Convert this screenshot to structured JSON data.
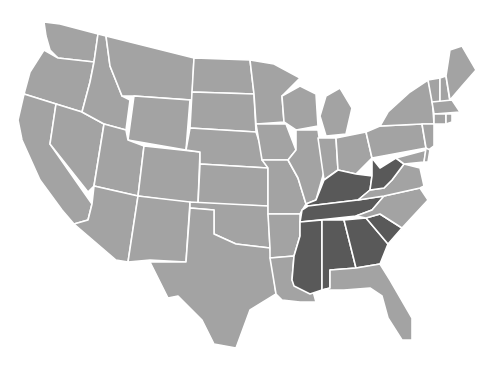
{
  "map": {
    "title": "United States map with highlighted southeastern states",
    "colors": {
      "background": "#ffffff",
      "default_state": "#a3a3a3",
      "highlighted_state": "#595959",
      "border": "#ffffff"
    },
    "highlighted_states": [
      "West Virginia",
      "Kentucky",
      "Tennessee",
      "Mississippi",
      "Alabama",
      "Georgia",
      "South Carolina"
    ],
    "states": [
      {
        "id": "WA",
        "name": "Washington",
        "highlighted": false,
        "points": "44,22 60,24 98,34 94,62 58,58 50,50 46,36"
      },
      {
        "id": "OR",
        "name": "Oregon",
        "highlighted": false,
        "points": "24,94 30,72 44,50 58,58 94,62 90,82 82,112"
      },
      {
        "id": "CA",
        "name": "California",
        "highlighted": false,
        "points": "24,94 56,104 50,144 92,204 88,220 74,224 62,210 40,180 22,140 18,120"
      },
      {
        "id": "NV",
        "name": "Nevada",
        "highlighted": false,
        "points": "56,104 82,112 104,124 94,186 88,192 50,144"
      },
      {
        "id": "ID",
        "name": "Idaho",
        "highlighted": false,
        "points": "98,34 106,36 110,66 122,96 130,100 126,130 104,124 82,112 90,82 94,62"
      },
      {
        "id": "MT",
        "name": "Montana",
        "highlighted": false,
        "points": "106,36 194,58 192,100 134,96 122,96 110,66"
      },
      {
        "id": "WY",
        "name": "Wyoming",
        "highlighted": false,
        "points": "134,96 190,100 186,150 128,140"
      },
      {
        "id": "UT",
        "name": "Utah",
        "highlighted": false,
        "points": "104,124 126,130 128,140 144,146 138,196 94,186"
      },
      {
        "id": "CO",
        "name": "Colorado",
        "highlighted": false,
        "points": "144,146 200,152 198,204 138,196"
      },
      {
        "id": "AZ",
        "name": "Arizona",
        "highlighted": false,
        "points": "94,186 138,196 128,262 116,260 74,224 88,220 92,204"
      },
      {
        "id": "NM",
        "name": "New Mexico",
        "highlighted": false,
        "points": "138,196 190,202 186,262 150,260 128,262"
      },
      {
        "id": "ND",
        "name": "North Dakota",
        "highlighted": false,
        "points": "194,58 250,60 254,94 192,92"
      },
      {
        "id": "SD",
        "name": "South Dakota",
        "highlighted": false,
        "points": "192,92 254,94 256,132 190,128"
      },
      {
        "id": "NE",
        "name": "Nebraska",
        "highlighted": false,
        "points": "190,128 256,132 268,168 200,164 200,152 186,150"
      },
      {
        "id": "KS",
        "name": "Kansas",
        "highlighted": false,
        "points": "200,164 268,168 268,206 198,204"
      },
      {
        "id": "OK",
        "name": "Oklahoma",
        "highlighted": false,
        "points": "190,202 268,206 270,248 236,244 214,234 214,210 190,208"
      },
      {
        "id": "TX",
        "name": "Texas",
        "highlighted": false,
        "points": "190,208 214,210 214,234 236,244 270,248 276,294 250,310 236,348 214,344 202,320 178,296 168,298 150,262 186,262"
      },
      {
        "id": "MN",
        "name": "Minnesota",
        "highlighted": false,
        "points": "250,60 274,64 300,78 282,96 284,122 256,124 254,94"
      },
      {
        "id": "IA",
        "name": "Iowa",
        "highlighted": false,
        "points": "256,124 286,124 296,150 288,160 262,160"
      },
      {
        "id": "MO",
        "name": "Missouri",
        "highlighted": false,
        "points": "262,160 288,160 298,178 306,204 300,214 268,214 268,168"
      },
      {
        "id": "AR",
        "name": "Arkansas",
        "highlighted": false,
        "points": "268,214 300,214 300,236 294,256 270,258 270,248"
      },
      {
        "id": "LA",
        "name": "Louisiana",
        "highlighted": false,
        "points": "270,258 294,256 292,280 310,280 316,302 300,302 282,300 276,294"
      },
      {
        "id": "WI",
        "name": "Wisconsin",
        "highlighted": false,
        "points": "282,96 300,86 316,94 318,126 296,130 284,122"
      },
      {
        "id": "IL",
        "name": "Illinois",
        "highlighted": false,
        "points": "296,130 318,130 324,172 316,200 306,204 298,178 288,160 296,150"
      },
      {
        "id": "MI",
        "name": "Michigan",
        "highlighted": false,
        "points": "326,96 340,88 352,108 346,134 326,136 320,116"
      },
      {
        "id": "IN",
        "name": "Indiana",
        "highlighted": false,
        "points": "318,138 336,138 338,170 324,180"
      },
      {
        "id": "OH",
        "name": "Ohio",
        "highlighted": false,
        "points": "336,138 366,132 372,158 356,174 338,170"
      },
      {
        "id": "KY",
        "name": "Kentucky",
        "highlighted": true,
        "points": "306,204 316,200 324,180 338,170 356,174 372,176 370,190 358,200 308,206"
      },
      {
        "id": "TN",
        "name": "Tennessee",
        "highlighted": true,
        "points": "302,210 308,206 358,200 384,196 372,210 356,216 300,222"
      },
      {
        "id": "MS",
        "name": "Mississippi",
        "highlighted": true,
        "points": "300,222 322,220 322,290 310,294 294,286 292,280 294,256 300,236"
      },
      {
        "id": "AL",
        "name": "Alabama",
        "highlighted": true,
        "points": "322,220 344,220 356,268 330,270 330,288 322,290"
      },
      {
        "id": "GA",
        "name": "Georgia",
        "highlighted": true,
        "points": "344,220 366,218 388,244 380,264 356,268"
      },
      {
        "id": "SC",
        "name": "South Carolina",
        "highlighted": true,
        "points": "366,218 380,214 402,228 388,244"
      },
      {
        "id": "FL",
        "name": "Florida",
        "highlighted": false,
        "points": "322,290 330,288 330,270 356,268 380,264 390,280 412,318 412,340 402,340 388,318 382,296 370,288 344,290"
      },
      {
        "id": "NC",
        "name": "North Carolina",
        "highlighted": false,
        "points": "356,216 372,210 384,196 420,188 428,200 402,228 380,214 366,218"
      },
      {
        "id": "VA",
        "name": "Virginia",
        "highlighted": false,
        "points": "370,190 384,188 392,180 404,164 420,168 424,186 420,188 384,196 358,200"
      },
      {
        "id": "WV",
        "name": "West Virginia",
        "highlighted": true,
        "points": "372,176 372,158 380,168 396,158 404,164 392,180 384,188 370,190"
      },
      {
        "id": "PA",
        "name": "Pennsylvania",
        "highlighted": false,
        "points": "366,132 380,126 422,124 426,148 372,158"
      },
      {
        "id": "NY",
        "name": "New York",
        "highlighted": false,
        "points": "380,126 388,112 410,92 428,80 432,96 434,124 422,124"
      },
      {
        "id": "NJ",
        "name": "New Jersey",
        "highlighted": false,
        "points": "422,124 434,124 434,146 426,152 426,148"
      },
      {
        "id": "MD",
        "name": "Maryland",
        "highlighted": false,
        "points": "396,158 426,150 424,162 404,164"
      },
      {
        "id": "DE",
        "name": "Delaware",
        "highlighted": false,
        "points": "426,148 430,150 428,162 424,162"
      },
      {
        "id": "VT",
        "name": "Vermont",
        "highlighted": false,
        "points": "428,80 440,78 440,102 432,102"
      },
      {
        "id": "NH",
        "name": "New Hampshire",
        "highlighted": false,
        "points": "440,78 446,76 450,102 440,102"
      },
      {
        "id": "ME",
        "name": "Maine",
        "highlighted": false,
        "points": "446,76 450,50 462,46 476,70 462,86 450,100"
      },
      {
        "id": "MA",
        "name": "Massachusetts",
        "highlighted": false,
        "points": "432,102 452,100 460,112 434,114"
      },
      {
        "id": "CT",
        "name": "Connecticut",
        "highlighted": false,
        "points": "434,114 446,114 446,124 434,124"
      },
      {
        "id": "RI",
        "name": "Rhode Island",
        "highlighted": false,
        "points": "446,114 452,114 452,122 446,124"
      }
    ]
  }
}
